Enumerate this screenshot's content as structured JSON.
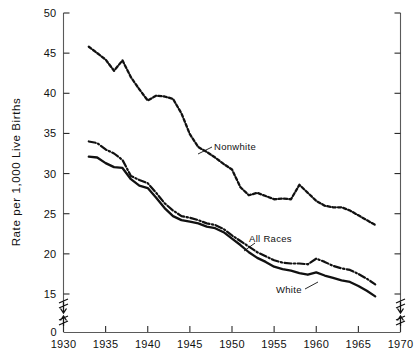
{
  "chart_data": {
    "type": "line",
    "title": "",
    "subtitle": "",
    "xlabel": "",
    "ylabel": "Rate per 1,000 Live Births",
    "xlim": [
      1930,
      1970
    ],
    "ylim": [
      15,
      50
    ],
    "y_axis_break": true,
    "y_axis_break_note": "axis broken between 0 and 15",
    "y_zero_label": "0",
    "grid": false,
    "legend_position": "inline-annotations",
    "xticks": [
      1930,
      1935,
      1940,
      1945,
      1950,
      1955,
      1960,
      1965,
      1970
    ],
    "xtick_labels": [
      "1930",
      "1935",
      "1940",
      "1945",
      "1950",
      "1955",
      "1960",
      "1965",
      "1970"
    ],
    "yticks": [
      15,
      20,
      25,
      30,
      35,
      40,
      45,
      50
    ],
    "ytick_labels": [
      "15",
      "20",
      "25",
      "30",
      "35",
      "40",
      "45",
      "50"
    ],
    "right_axis_ticks_unlabeled": true,
    "x": [
      1933,
      1934,
      1935,
      1936,
      1937,
      1938,
      1939,
      1940,
      1941,
      1942,
      1943,
      1944,
      1945,
      1946,
      1947,
      1948,
      1949,
      1950,
      1951,
      1952,
      1953,
      1954,
      1955,
      1956,
      1957,
      1958,
      1959,
      1960,
      1961,
      1962,
      1963,
      1964,
      1965,
      1966,
      1967
    ],
    "series": [
      {
        "name": "Nonwhite",
        "style": "dotted",
        "label": "Nonwhite",
        "values": [
          45.8,
          45.0,
          44.2,
          42.8,
          44.1,
          42.0,
          40.5,
          39.1,
          39.7,
          39.6,
          39.3,
          37.5,
          34.9,
          33.3,
          32.7,
          32.0,
          31.2,
          30.5,
          28.3,
          27.3,
          27.6,
          27.2,
          26.8,
          26.9,
          26.8,
          28.6,
          27.6,
          26.6,
          26.0,
          25.8,
          25.8,
          25.4,
          24.8,
          24.2,
          23.6
        ]
      },
      {
        "name": "All Races",
        "style": "dash-dot",
        "label": "All Races",
        "values": [
          34.0,
          33.8,
          33.0,
          32.5,
          31.7,
          29.7,
          29.2,
          28.8,
          27.6,
          26.3,
          25.4,
          24.7,
          24.5,
          24.2,
          23.8,
          23.6,
          23.1,
          22.3,
          21.6,
          20.9,
          20.2,
          19.7,
          19.2,
          18.9,
          18.8,
          18.8,
          18.7,
          19.4,
          19.0,
          18.5,
          18.2,
          18.0,
          17.5,
          16.9,
          16.2
        ]
      },
      {
        "name": "White",
        "style": "solid",
        "label": "White",
        "values": [
          32.1,
          32.0,
          31.3,
          30.8,
          30.7,
          29.3,
          28.5,
          28.2,
          27.0,
          25.7,
          24.7,
          24.2,
          24.0,
          23.8,
          23.4,
          23.2,
          22.7,
          21.9,
          21.1,
          20.2,
          19.5,
          19.0,
          18.4,
          18.1,
          17.9,
          17.6,
          17.4,
          17.7,
          17.3,
          17.0,
          16.7,
          16.5,
          16.0,
          15.4,
          14.7
        ]
      }
    ],
    "annotations": [
      {
        "text": "Nonwhite",
        "points_to_year": 1947,
        "points_to_value": 32.7
      },
      {
        "text": "All Races",
        "points_to_year": 1951,
        "points_to_value": 21.6
      },
      {
        "text": "White",
        "points_to_year": 1959,
        "points_to_value": 17.4
      }
    ]
  }
}
